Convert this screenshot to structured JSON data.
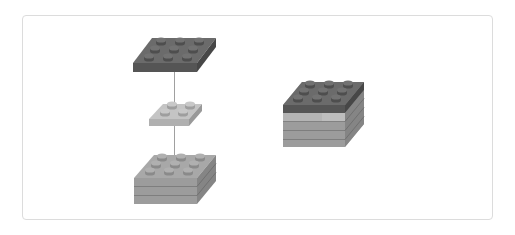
{
  "diagram": {
    "colors": {
      "dark_top": "#6b6b6b",
      "dark_front": "#555555",
      "dark_side": "#4a4a4a",
      "light_top": "#c4c4c4",
      "light_front": "#b0b0b0",
      "light_side": "#9a9a9a",
      "mid_top": "#a8a8a8",
      "mid_front": "#9c9c9c",
      "mid_side": "#878787",
      "border": "#dcdcdc",
      "connector": "#a0a0a0"
    },
    "exploded_view": {
      "parts": [
        {
          "name": "top-dark-plate",
          "studs": "3x3",
          "type": "plate"
        },
        {
          "name": "middle-light-plate",
          "studs": "2x2",
          "type": "plate"
        },
        {
          "name": "bottom-brick-stack",
          "studs": "3x3",
          "layers": 3
        }
      ],
      "connector": "vertical alignment line"
    },
    "assembled_view": {
      "parts": [
        "dark plate 3x3",
        "light plate 2x2 (embedded)",
        "grey stack 3 layers"
      ]
    }
  }
}
